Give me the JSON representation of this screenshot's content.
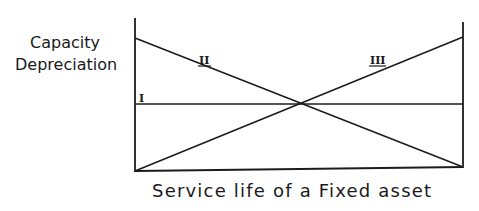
{
  "diagram": {
    "y_axis_label_line1": "Capacity",
    "y_axis_label_line2": "Depreciation",
    "x_axis_label": "Service life of a Fixed asset",
    "lines": [
      {
        "label": "I",
        "description": "constant (straight-line)",
        "start": [
          135,
          104
        ],
        "end": [
          463,
          104
        ]
      },
      {
        "label": "II",
        "description": "decreasing",
        "start": [
          135,
          38
        ],
        "end": [
          463,
          167
        ]
      },
      {
        "label": "III",
        "description": "increasing",
        "start": [
          135,
          171
        ],
        "end": [
          463,
          37
        ]
      }
    ],
    "intersection": [
      301,
      104
    ],
    "colors": {
      "ink": "#1c1c1c",
      "background": "#ffffff"
    }
  }
}
